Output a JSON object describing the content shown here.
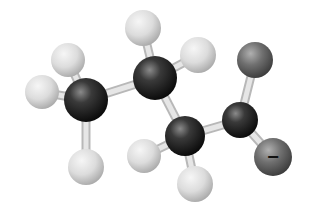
{
  "figure": {
    "type": "ball-and-stick molecular model",
    "background": "#ffffff"
  },
  "colors": {
    "carbon": "#2a2a2a",
    "hydrogen": "#d8d8d8",
    "oxygen": "#6a6a6a",
    "bond": "#e6e6e6"
  },
  "atoms": [
    {
      "id": "C1",
      "element": "C",
      "x": 86,
      "y": 100,
      "r": 22
    },
    {
      "id": "H1a",
      "element": "H",
      "x": 68,
      "y": 60,
      "r": 17
    },
    {
      "id": "H1b",
      "element": "H",
      "x": 42,
      "y": 92,
      "r": 17
    },
    {
      "id": "H1c",
      "element": "H",
      "x": 86,
      "y": 167,
      "r": 18
    },
    {
      "id": "C2",
      "element": "C",
      "x": 155,
      "y": 78,
      "r": 22
    },
    {
      "id": "H2a",
      "element": "H",
      "x": 143,
      "y": 28,
      "r": 18
    },
    {
      "id": "H2b",
      "element": "H",
      "x": 198,
      "y": 55,
      "r": 18
    },
    {
      "id": "C3",
      "element": "C",
      "x": 185,
      "y": 136,
      "r": 20
    },
    {
      "id": "H3a",
      "element": "H",
      "x": 144,
      "y": 156,
      "r": 17
    },
    {
      "id": "H3b",
      "element": "H",
      "x": 195,
      "y": 184,
      "r": 18
    },
    {
      "id": "C4",
      "element": "C",
      "x": 240,
      "y": 120,
      "r": 18
    },
    {
      "id": "O1",
      "element": "O",
      "x": 255,
      "y": 60,
      "r": 18
    },
    {
      "id": "O2",
      "element": "O",
      "x": 273,
      "y": 157,
      "r": 19
    }
  ],
  "bonds": [
    [
      "C1",
      "H1a"
    ],
    [
      "C1",
      "H1b"
    ],
    [
      "C1",
      "H1c"
    ],
    [
      "C1",
      "C2"
    ],
    [
      "C2",
      "H2a"
    ],
    [
      "C2",
      "H2b"
    ],
    [
      "C2",
      "C3"
    ],
    [
      "C3",
      "H3a"
    ],
    [
      "C3",
      "H3b"
    ],
    [
      "C3",
      "C4"
    ],
    [
      "C4",
      "O1"
    ],
    [
      "C4",
      "O2"
    ]
  ],
  "labels": {
    "charge": "−",
    "charge_atom": "O2"
  }
}
